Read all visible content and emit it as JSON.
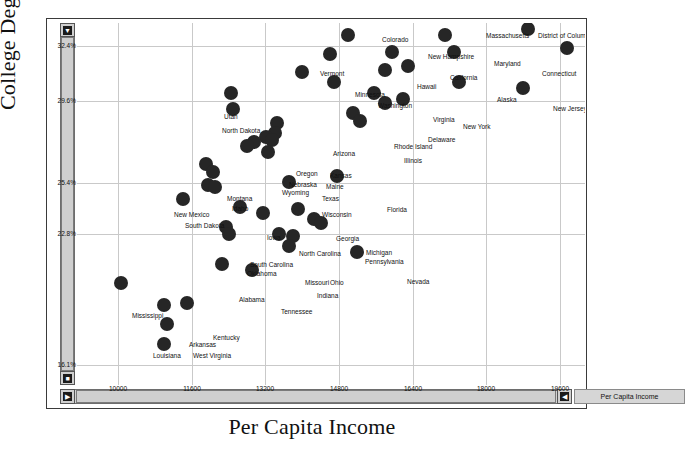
{
  "axes": {
    "y_title": "College Degree %",
    "x_title": "Per Capita Income",
    "y_ticks": [
      "32.4%",
      "29.6%",
      "25.4%",
      "22.8%",
      "16.1%"
    ],
    "x_ticks": [
      "10000",
      "11600",
      "13200",
      "14800",
      "16400",
      "18000",
      "19600"
    ]
  },
  "legend": {
    "variable_label": "Per Capita Income"
  },
  "scrollbars": {
    "up_glyph": "▼",
    "down_glyph": "■",
    "left_glyph": "▶",
    "right_glyph": "◀"
  },
  "chart_data": {
    "type": "scatter",
    "title": "",
    "xlabel": "Per Capita Income",
    "ylabel": "College Degree %",
    "xlim": [
      9100,
      20150
    ],
    "ylim": [
      15.1,
      33.6
    ],
    "grid": true,
    "legend_position": "bottom-right",
    "xticks": [
      10000,
      11600,
      13200,
      14800,
      16400,
      18000,
      19600
    ],
    "yticks": [
      32.4,
      29.6,
      25.4,
      22.8,
      16.1
    ],
    "point_label_field": "state",
    "points": [
      {
        "state": "District of Columbia",
        "x": 18900,
        "y": 33.3
      },
      {
        "state": "Massachusetts",
        "x": 17100,
        "y": 33.0
      },
      {
        "state": "Colorado",
        "x": 15000,
        "y": 33.0
      },
      {
        "state": "Connecticut",
        "x": 19750,
        "y": 32.3
      },
      {
        "state": "Maryland",
        "x": 17300,
        "y": 32.1
      },
      {
        "state": "New Hampshire",
        "x": 15950,
        "y": 32.1
      },
      {
        "state": "Vermont",
        "x": 14600,
        "y": 32.0
      },
      {
        "state": "California",
        "x": 16300,
        "y": 31.4
      },
      {
        "state": "Hawaii",
        "x": 15800,
        "y": 31.2
      },
      {
        "state": "Minnesota",
        "x": 14000,
        "y": 31.1
      },
      {
        "state": "Alaska",
        "x": 17400,
        "y": 30.6
      },
      {
        "state": "Washington",
        "x": 14700,
        "y": 30.6
      },
      {
        "state": "New Jersey",
        "x": 18800,
        "y": 30.3
      },
      {
        "state": "Virginia",
        "x": 15550,
        "y": 30.0
      },
      {
        "state": "Utah",
        "x": 12450,
        "y": 30.0
      },
      {
        "state": "New York",
        "x": 16200,
        "y": 29.7
      },
      {
        "state": "Delaware",
        "x": 15800,
        "y": 29.5
      },
      {
        "state": "North Dakota",
        "x": 12500,
        "y": 29.2
      },
      {
        "state": "Rhode Island",
        "x": 15100,
        "y": 29.0
      },
      {
        "state": "Illinois",
        "x": 15250,
        "y": 28.6
      },
      {
        "state": "Arizona",
        "x": 13450,
        "y": 28.5
      },
      {
        "state": "Kansas",
        "x": 13400,
        "y": 28.0
      },
      {
        "state": "Oregon",
        "x": 13200,
        "y": 27.8
      },
      {
        "state": "Maine",
        "x": 13350,
        "y": 27.6
      },
      {
        "state": "Nebraska",
        "x": 12950,
        "y": 27.5
      },
      {
        "state": "Wyoming",
        "x": 12800,
        "y": 27.3
      },
      {
        "state": "Texas",
        "x": 13250,
        "y": 27.0
      },
      {
        "state": "Montana",
        "x": 11900,
        "y": 26.4
      },
      {
        "state": "Idaho",
        "x": 12050,
        "y": 26.0
      },
      {
        "state": "Florida",
        "x": 14750,
        "y": 25.8
      },
      {
        "state": "Wisconsin",
        "x": 13700,
        "y": 25.5
      },
      {
        "state": "New Mexico",
        "x": 11950,
        "y": 25.3
      },
      {
        "state": "South Dakota",
        "x": 12100,
        "y": 25.2
      },
      {
        "state": "Nevada",
        "x": 11400,
        "y": 24.6
      },
      {
        "state": "Iowa",
        "x": 12650,
        "y": 24.2
      },
      {
        "state": "Georgia",
        "x": 13900,
        "y": 24.1
      },
      {
        "state": "North Carolina",
        "x": 13150,
        "y": 23.9
      },
      {
        "state": "Michigan",
        "x": 14250,
        "y": 23.6
      },
      {
        "state": "Pennsylvania",
        "x": 14400,
        "y": 23.4
      },
      {
        "state": "South Carolina",
        "x": 12350,
        "y": 23.2
      },
      {
        "state": "Oklahoma",
        "x": 12400,
        "y": 22.8
      },
      {
        "state": "Missouri",
        "x": 13500,
        "y": 22.8
      },
      {
        "state": "Ohio",
        "x": 13800,
        "y": 22.7
      },
      {
        "state": "Indiana",
        "x": 13700,
        "y": 22.2
      },
      {
        "state": "Nevada2",
        "x": 15200,
        "y": 21.9
      },
      {
        "state": "Alabama",
        "x": 12250,
        "y": 21.3
      },
      {
        "state": "Tennessee",
        "x": 12900,
        "y": 21.0
      },
      {
        "state": "Mississippi",
        "x": 10050,
        "y": 20.3
      },
      {
        "state": "Kentucky",
        "x": 11500,
        "y": 19.3
      },
      {
        "state": "Arkansas",
        "x": 11000,
        "y": 19.2
      },
      {
        "state": "Louisiana",
        "x": 11050,
        "y": 18.2
      },
      {
        "state": "West Virginia",
        "x": 11000,
        "y": 17.2
      }
    ],
    "labels": [
      {
        "text": "Colorado",
        "px": 305,
        "py": 13
      },
      {
        "text": "Massachusetts",
        "px": 409,
        "py": 9
      },
      {
        "text": "District of Columbia",
        "px": 461,
        "py": 9
      },
      {
        "text": "New Hampshire",
        "px": 351,
        "py": 30
      },
      {
        "text": "Maryland",
        "px": 417,
        "py": 37
      },
      {
        "text": "Connecticut",
        "px": 465,
        "py": 47
      },
      {
        "text": "Vermont",
        "px": 243,
        "py": 47
      },
      {
        "text": "California",
        "px": 373,
        "py": 51
      },
      {
        "text": "Hawaii",
        "px": 340,
        "py": 60
      },
      {
        "text": "Minnesota",
        "px": 278,
        "py": 68
      },
      {
        "text": "Washington",
        "px": 301,
        "py": 79
      },
      {
        "text": "Alaska",
        "px": 420,
        "py": 73
      },
      {
        "text": "New Jersey",
        "px": 476,
        "py": 82
      },
      {
        "text": "Virginia",
        "px": 356,
        "py": 93
      },
      {
        "text": "New York",
        "px": 386,
        "py": 100
      },
      {
        "text": "Delaware",
        "px": 351,
        "py": 113
      },
      {
        "text": "Utah",
        "px": 147,
        "py": 90
      },
      {
        "text": "North Dakota",
        "px": 145,
        "py": 104
      },
      {
        "text": "Rhode Island",
        "px": 317,
        "py": 120
      },
      {
        "text": "Illinois",
        "px": 327,
        "py": 134
      },
      {
        "text": "Arizona",
        "px": 256,
        "py": 127
      },
      {
        "text": "Oregon",
        "px": 219,
        "py": 147
      },
      {
        "text": "Kansas",
        "px": 253,
        "py": 149
      },
      {
        "text": "Nebraska",
        "px": 212,
        "py": 158
      },
      {
        "text": "Maine",
        "px": 249,
        "py": 160
      },
      {
        "text": "Wyoming",
        "px": 205,
        "py": 166
      },
      {
        "text": "Texas",
        "px": 245,
        "py": 172
      },
      {
        "text": "Montana",
        "px": 150,
        "py": 172
      },
      {
        "text": "Idaho",
        "px": 155,
        "py": 182
      },
      {
        "text": "Florida",
        "px": 310,
        "py": 183
      },
      {
        "text": "Wisconsin",
        "px": 245,
        "py": 188
      },
      {
        "text": "New Mexico",
        "px": 97,
        "py": 188
      },
      {
        "text": "South Dakota",
        "px": 108,
        "py": 199
      },
      {
        "text": "Iowa",
        "px": 190,
        "py": 211
      },
      {
        "text": "Georgia",
        "px": 259,
        "py": 212
      },
      {
        "text": "North Carolina",
        "px": 222,
        "py": 227
      },
      {
        "text": "Michigan",
        "px": 289,
        "py": 226
      },
      {
        "text": "Pennsylvania",
        "px": 288,
        "py": 235
      },
      {
        "text": "South Carolina",
        "px": 173,
        "py": 238
      },
      {
        "text": "Oklahoma",
        "px": 170,
        "py": 247
      },
      {
        "text": "Missouri",
        "px": 228,
        "py": 256
      },
      {
        "text": "Ohio",
        "px": 253,
        "py": 256
      },
      {
        "text": "Indiana",
        "px": 240,
        "py": 269
      },
      {
        "text": "Nevada",
        "px": 330,
        "py": 255
      },
      {
        "text": "Alabama",
        "px": 162,
        "py": 273
      },
      {
        "text": "Tennessee",
        "px": 204,
        "py": 285
      },
      {
        "text": "Mississippi",
        "px": 55,
        "py": 289
      },
      {
        "text": "Kentucky",
        "px": 136,
        "py": 311
      },
      {
        "text": "Arkansas",
        "px": 112,
        "py": 318
      },
      {
        "text": "Louisiana",
        "px": 76,
        "py": 329
      },
      {
        "text": "West Virginia",
        "px": 116,
        "py": 329
      }
    ]
  }
}
